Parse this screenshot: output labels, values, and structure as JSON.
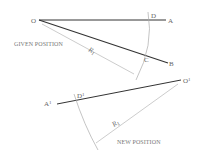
{
  "diagram": {
    "given": {
      "caption": "GIVEN POSITION",
      "labels": {
        "o": "O",
        "a": "A",
        "b": "B",
        "c": "C",
        "d": "D",
        "r": "R",
        "r_sub": "1"
      }
    },
    "new": {
      "caption": "NEW POSITION",
      "labels": {
        "o": "O",
        "o_sup": "1",
        "a": "A",
        "a_sup": "1",
        "d": "D",
        "d_sup": "1",
        "r": "R",
        "r_sub": "1"
      }
    },
    "colors": {
      "line": "#333333",
      "thin": "#999999",
      "text": "#666666"
    }
  }
}
